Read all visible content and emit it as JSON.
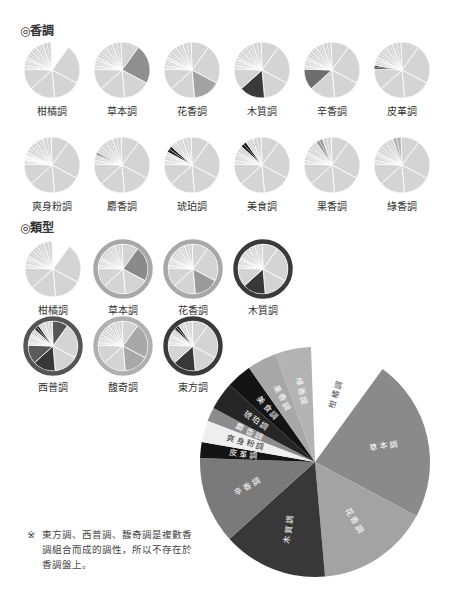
{
  "sections": {
    "scent_notes_title": "◎香調",
    "types_title": "◎類型"
  },
  "scent_notes": [
    {
      "label": "柑橘調",
      "highlight": 0,
      "highlight_color": "#ffffff",
      "missing": true
    },
    {
      "label": "草本調",
      "highlight": 1,
      "highlight_color": "#8f8f8f"
    },
    {
      "label": "花香調",
      "highlight": 2,
      "highlight_color": "#a2a2a2"
    },
    {
      "label": "木質調",
      "highlight": 3,
      "highlight_color": "#3a3a3a"
    },
    {
      "label": "辛香調",
      "highlight": 4,
      "highlight_color": "#6e6e6e"
    },
    {
      "label": "皮革調",
      "highlight": 5,
      "highlight_color": "#1a1a1a"
    },
    {
      "label": "爽身粉調",
      "highlight": 6,
      "highlight_color": "#ffffff"
    },
    {
      "label": "麝香調",
      "highlight": 7,
      "highlight_color": "#777777"
    },
    {
      "label": "琥珀調",
      "highlight": 8,
      "highlight_color": "#222222"
    },
    {
      "label": "美食調",
      "highlight": 9,
      "highlight_color": "#151515"
    },
    {
      "label": "果香調",
      "highlight": 10,
      "highlight_color": "#9a9a9a"
    },
    {
      "label": "綠香調",
      "highlight": 11,
      "highlight_color": "#b5b5b5"
    }
  ],
  "types": [
    {
      "label": "柑橘調",
      "ring": null,
      "dark": [],
      "ring_color": null,
      "missing_citrus": true
    },
    {
      "label": "草本調",
      "ring": "#a8a8a8",
      "dark": [
        1
      ],
      "ring_color": "#a8a8a8"
    },
    {
      "label": "花香調",
      "ring": "#a8a8a8",
      "dark": [
        2
      ],
      "ring_color": "#a8a8a8"
    },
    {
      "label": "木質調",
      "ring": "#3a3a3a",
      "dark": [
        3
      ],
      "ring_color": "#3a3a3a"
    },
    {
      "label": "西普調",
      "ring": "#555555",
      "dark": [
        0,
        3,
        4,
        9
      ],
      "ring_color": "#555555"
    },
    {
      "label": "馥奇調",
      "ring": "#b0b0b0",
      "dark": [
        1,
        2,
        7
      ],
      "ring_color": "#b0b0b0"
    },
    {
      "label": "東方調",
      "ring": "#3a3a3a",
      "dark": [
        3,
        9
      ],
      "ring_color": "#3a3a3a"
    }
  ],
  "chart_data": {
    "type": "pie",
    "title": "香調盤",
    "categories": [
      "柑橘調",
      "草本調",
      "花香調",
      "木質調",
      "辛香調",
      "皮革調",
      "爽身粉調",
      "麝香調",
      "琥珀調",
      "美食調",
      "果香調",
      "綠香調"
    ],
    "start_angles_deg": [
      -2,
      36,
      118,
      175,
      228,
      272,
      280,
      291,
      298,
      312,
      325,
      340
    ],
    "end_angles_deg": [
      36,
      118,
      175,
      228,
      272,
      280,
      291,
      298,
      312,
      325,
      340,
      358
    ],
    "values": [
      38,
      82,
      57,
      53,
      44,
      8,
      11,
      7,
      14,
      13,
      15,
      18
    ],
    "colors": [
      "#ffffff",
      "#8a8a8a",
      "#a3a3a3",
      "#383838",
      "#7a7a7a",
      "#141414",
      "#eeeeee",
      "#8c8c8c",
      "#262626",
      "#141414",
      "#a8a8a8",
      "#b3b3b3"
    ],
    "label_colors": [
      "#555555",
      "#ffffff",
      "#ffffff",
      "#ffffff",
      "#ffffff",
      "#ffffff",
      "#333333",
      "#ffffff",
      "#ffffff",
      "#ffffff",
      "#ffffff",
      "#ffffff"
    ]
  },
  "note": {
    "mark": "※",
    "text": "東方調、西普調、馥奇調是複數香調組合而成的調性，所以不存在於香調盤上。"
  }
}
